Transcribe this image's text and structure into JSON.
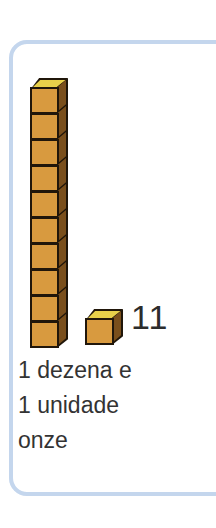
{
  "card": {
    "border_color": "#b7cdea",
    "background": "#ffffff"
  },
  "manipulative": {
    "kind": "base-ten-blocks",
    "rod": {
      "name": "ten-rod",
      "cube_count": 10,
      "orientation": "vertical"
    },
    "unit": {
      "name": "unit-cube",
      "cube_count": 1
    },
    "cube_colors": {
      "top_face": "#e8d04a",
      "front_face": "#d89a3f",
      "right_face": "#7a4f1c",
      "outline": "#20160a"
    }
  },
  "count_label": "11",
  "caption": {
    "line1": "1 dezena e",
    "line2": "1 unidade",
    "line3": "onze"
  },
  "text_color": "#333333"
}
